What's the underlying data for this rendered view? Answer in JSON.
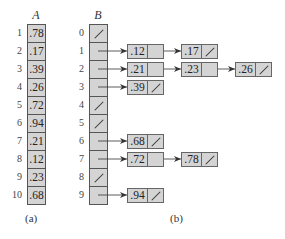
{
  "figure": {
    "array_a": {
      "title": "A",
      "caption": "(a)",
      "indices": [
        "1",
        "2",
        "3",
        "4",
        "5",
        "6",
        "7",
        "8",
        "9",
        "10"
      ],
      "values": [
        ".78",
        ".17",
        ".39",
        ".26",
        ".72",
        ".94",
        ".21",
        ".12",
        ".23",
        ".68"
      ]
    },
    "array_b": {
      "title": "B",
      "caption": "(b)",
      "indices": [
        "0",
        "1",
        "2",
        "3",
        "4",
        "5",
        "6",
        "7",
        "8",
        "9"
      ],
      "buckets": [
        {
          "index": "0",
          "list": []
        },
        {
          "index": "1",
          "list": [
            ".12",
            ".17"
          ]
        },
        {
          "index": "2",
          "list": [
            ".21",
            ".23",
            ".26"
          ]
        },
        {
          "index": "3",
          "list": [
            ".39"
          ]
        },
        {
          "index": "4",
          "list": []
        },
        {
          "index": "5",
          "list": []
        },
        {
          "index": "6",
          "list": [
            ".68"
          ]
        },
        {
          "index": "7",
          "list": [
            ".72",
            ".78"
          ]
        },
        {
          "index": "8",
          "list": []
        },
        {
          "index": "9",
          "list": [
            ".94"
          ]
        }
      ]
    },
    "null_symbol": "/",
    "colors": {
      "cell_fill": "#d4d4d4",
      "border": "#555555",
      "text": "#222222"
    }
  }
}
